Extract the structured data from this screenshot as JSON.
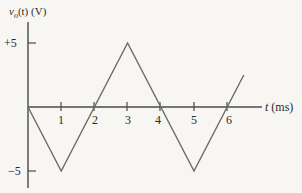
{
  "chart_data": {
    "type": "line",
    "title": "",
    "ylabel": "v_o(t) (V)",
    "ylabel_parts": {
      "v": "v",
      "sub": "o",
      "rest": "(t) (V)"
    },
    "xlabel": "t (ms)",
    "x_ticks": [
      "1",
      "2",
      "3",
      "4",
      "5",
      "6"
    ],
    "y_ticks": [
      "+5",
      "−5"
    ],
    "xlim": [
      0,
      7
    ],
    "ylim": [
      -5,
      5
    ],
    "grid": false,
    "legend": null,
    "series": [
      {
        "name": "v_o(t)",
        "shape": "triangle wave",
        "x": [
          0,
          1,
          3,
          5,
          6.5
        ],
        "y": [
          0,
          -5,
          5,
          -5,
          2.5
        ]
      }
    ],
    "zero_crossings_ms": [
      0,
      2,
      4,
      6
    ]
  },
  "colors": {
    "background": "#f7f6f3",
    "axis": "#4a4a4a",
    "waveform": "#6b6b6b",
    "text": "#2a2a2a"
  }
}
